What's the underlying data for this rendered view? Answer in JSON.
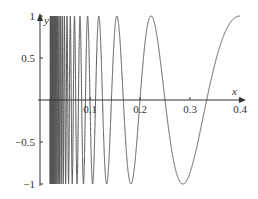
{
  "chart_data": {
    "type": "line",
    "title": "",
    "function": "y = sin(pi/x)",
    "xlabel": "x",
    "ylabel": "y",
    "xlim": [
      0,
      0.4
    ],
    "ylim": [
      -1,
      1
    ],
    "xticks": [
      "0.1",
      "0.2",
      "0.3",
      "0.4"
    ],
    "yticks": [
      "1",
      "0.5",
      "−0.5",
      "−1"
    ],
    "grid": false,
    "legend": null,
    "series": [
      {
        "name": "sin(π/x)",
        "x_start": 0.02,
        "x_end": 0.4,
        "color": "#555555"
      }
    ]
  }
}
